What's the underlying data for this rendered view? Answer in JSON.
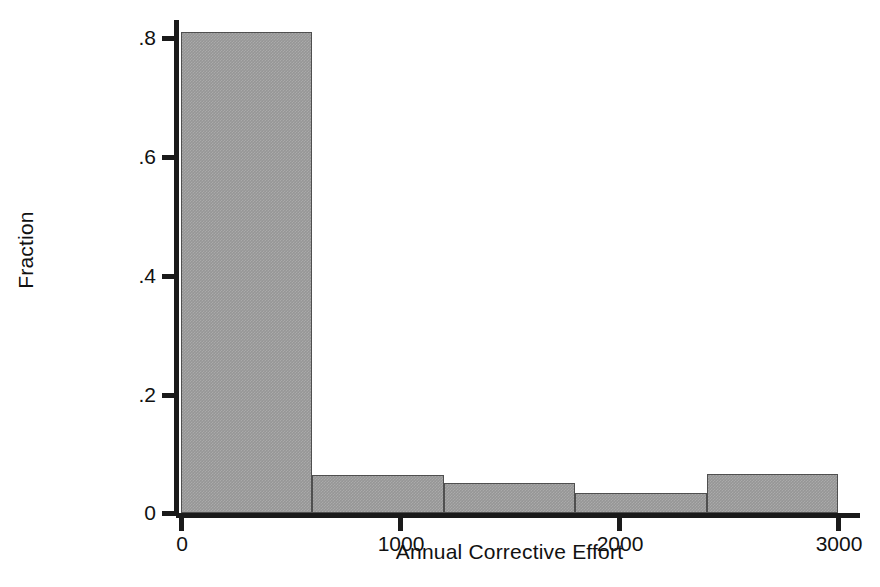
{
  "chart_data": {
    "type": "bar",
    "title": "",
    "subtitle": "",
    "xlabel": "Annual Corrective Effort",
    "ylabel": "Fraction",
    "categories": [
      "0-600",
      "600-1200",
      "1200-1800",
      "1800-2400",
      "2400-3000"
    ],
    "bin_edges": [
      0,
      600,
      1200,
      1800,
      2400,
      3000
    ],
    "values": [
      0.807,
      0.063,
      0.05,
      0.034,
      0.065
    ],
    "series": [
      {
        "name": "Fraction",
        "values": [
          0.807,
          0.063,
          0.05,
          0.034,
          0.065
        ]
      }
    ],
    "xlim": [
      0,
      3000
    ],
    "ylim": [
      0,
      0.84
    ],
    "xticks": [
      0,
      1000,
      2000,
      3000
    ],
    "xticklabels": [
      "0",
      "1000",
      "2000",
      "3000"
    ],
    "yticks": [
      0,
      0.2,
      0.4,
      0.6,
      0.8
    ],
    "yticklabels": [
      "0",
      ".2",
      ".4",
      ".6",
      ".8"
    ],
    "grid": false,
    "legend": null,
    "bar_fill_color": "#969696",
    "bar_edge_color": "#4f4f4f",
    "axis_color": "#1a1a1a"
  },
  "axes": {
    "y_title": "Fraction",
    "x_title": "Annual Corrective Effort",
    "y_ticklabels": [
      {
        "text": ".8",
        "value": 0.8
      },
      {
        "text": ".6",
        "value": 0.6
      },
      {
        "text": ".4",
        "value": 0.4
      },
      {
        "text": ".2",
        "value": 0.2
      },
      {
        "text": "0",
        "value": 0
      }
    ],
    "x_ticklabels": [
      {
        "text": "0",
        "value": 0
      },
      {
        "text": "1000",
        "value": 1000
      },
      {
        "text": "2000",
        "value": 2000
      },
      {
        "text": "3000",
        "value": 3000
      }
    ]
  }
}
